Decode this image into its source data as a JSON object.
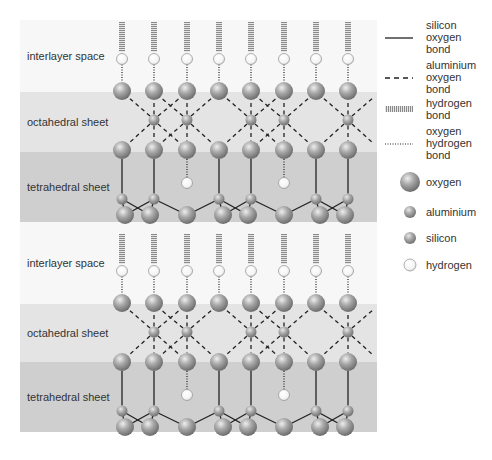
{
  "colors": {
    "interlayer": "#f7f7f7",
    "octahedral": "#e4e4e4",
    "tetrahedral": "#cfcfcf",
    "bond": "#222222"
  },
  "layers": [
    {
      "bands": [
        {
          "type": "interlayer",
          "label": "interlayer space",
          "y0": 20,
          "y1": 92
        },
        {
          "type": "octahedral",
          "label": "octahedral sheet",
          "y0": 92,
          "y1": 152
        },
        {
          "type": "tetrahedral",
          "label": "tetrahedral sheet",
          "y0": 152,
          "y1": 222
        }
      ],
      "offsetY": 0
    },
    {
      "bands": [
        {
          "type": "interlayer",
          "label": "interlayer space",
          "y0": 222,
          "y1": 304
        },
        {
          "type": "octahedral",
          "label": "octahedral sheet",
          "y0": 304,
          "y1": 362
        },
        {
          "type": "tetrahedral",
          "label": "tetrahedral sheet",
          "y0": 362,
          "y1": 432
        }
      ],
      "offsetY": 212
    }
  ],
  "structure": {
    "columns": [
      122,
      154,
      187,
      219,
      251,
      284,
      316,
      348
    ],
    "aluminium_x": [
      154,
      187,
      251,
      284,
      348
    ],
    "silicon_x": [
      122,
      154,
      219,
      251,
      316,
      348
    ],
    "inner_hydroxyl_x": [
      187,
      284
    ],
    "bottom_oxygen_x": [
      125,
      150,
      187,
      223,
      248,
      284,
      320,
      345
    ]
  },
  "legend": {
    "bonds": [
      {
        "style": "solid",
        "lines": [
          "silicon",
          "oxygen",
          "bond"
        ]
      },
      {
        "style": "dashed",
        "lines": [
          "aluminium",
          "oxygen",
          "bond"
        ]
      },
      {
        "style": "hbond",
        "lines": [
          "hydrogen",
          "bond"
        ]
      },
      {
        "style": "dotted",
        "lines": [
          "oxygen",
          "hydrogen",
          "bond"
        ]
      }
    ],
    "atoms": [
      {
        "name": "oxygen",
        "label": "oxygen"
      },
      {
        "name": "aluminium",
        "label": "aluminium"
      },
      {
        "name": "silicon",
        "label": "silicon"
      },
      {
        "name": "hydrogen",
        "label": "hydrogen"
      }
    ]
  }
}
